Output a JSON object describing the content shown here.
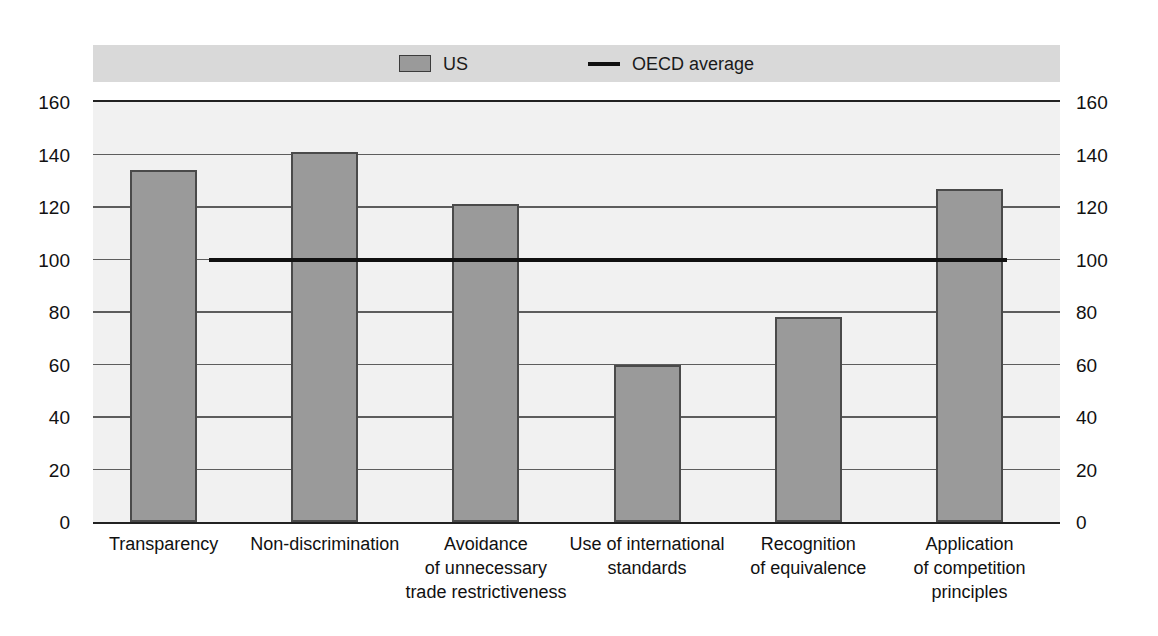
{
  "chart_data": {
    "type": "bar",
    "title": "",
    "xlabel": "",
    "ylabel": "",
    "ylim": [
      0,
      160
    ],
    "yticks": [
      0,
      20,
      40,
      60,
      80,
      100,
      120,
      140,
      160
    ],
    "grid": true,
    "legend_position": "top-center",
    "categories": [
      "Transparency",
      "Non-discrimination",
      "Avoidance\nof unnecessary\ntrade restrictiveness",
      "Use of international\nstandards",
      "Recognition\nof equivalence",
      "Application\nof competition\nprinciples"
    ],
    "series": [
      {
        "name": "US",
        "type": "bar",
        "color": "#9a9a9a",
        "values": [
          134,
          141,
          121,
          60,
          78,
          127
        ]
      },
      {
        "name": "OECD average",
        "type": "line",
        "color": "#111111",
        "value": 100
      }
    ],
    "legend": [
      {
        "label": "US",
        "marker": "filled-square",
        "color": "#9a9a9a"
      },
      {
        "label": "OECD average",
        "marker": "line",
        "color": "#111111"
      }
    ]
  },
  "axes": {
    "left_ticks": [
      "160",
      "140",
      "120",
      "100",
      "80",
      "60",
      "40",
      "20",
      "0"
    ],
    "right_ticks": [
      "160",
      "140",
      "120",
      "100",
      "80",
      "60",
      "40",
      "20",
      "0"
    ]
  },
  "categories_display": [
    {
      "lines": [
        "Transparency"
      ]
    },
    {
      "lines": [
        "Non-discrimination"
      ]
    },
    {
      "lines": [
        "Avoidance",
        "of unnecessary",
        "trade restrictiveness"
      ]
    },
    {
      "lines": [
        "Use of international",
        "standards"
      ]
    },
    {
      "lines": [
        "Recognition",
        "of equivalence"
      ]
    },
    {
      "lines": [
        "Application",
        "of competition",
        "principles"
      ]
    }
  ],
  "colors": {
    "bar_fill": "#9a9a9a",
    "bar_border": "#4a4a4a",
    "plot_background": "#f1f1f1",
    "legend_band": "#d9d9d9",
    "axis_line": "#222222",
    "gridline": "#5d5d5d",
    "average_line": "#111111"
  }
}
